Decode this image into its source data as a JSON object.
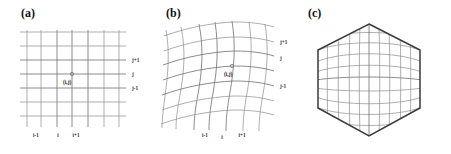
{
  "figure": {
    "background_color": "#ffffff",
    "width": 451,
    "height": 154
  },
  "colors": {
    "gridline": "#8c8c8c",
    "gridline_strong": "#6e6e6e",
    "hexagon_edge": "#3a3a3a",
    "text": "#1a1a1a"
  },
  "panels": [
    {
      "id": "a",
      "label": "(a)",
      "description": "regular cartesian structured grid",
      "node_label": "(i,j)",
      "x_axis_labels": [
        "i-1",
        "i",
        "i+1"
      ],
      "y_axis_labels": [
        "j+1",
        "j",
        "j-1"
      ],
      "vertical_lines": 6,
      "horizontal_lines": 7
    },
    {
      "id": "b",
      "label": "(b)",
      "description": "curvilinear body-fitted distorted grid",
      "node_label": "(i,j)",
      "x_axis_labels": [
        "i-1",
        "i",
        "i+1"
      ],
      "y_axis_labels": [
        "j+1",
        "j",
        "j-1"
      ],
      "vertical_lines": 6,
      "horizontal_lines": 7
    },
    {
      "id": "c",
      "label": "(c)",
      "description": "hexagonal domain with curvilinear mesh",
      "node_label": "",
      "x_axis_labels": [],
      "y_axis_labels": [],
      "vertical_lines": 9,
      "horizontal_lines": 9
    }
  ]
}
